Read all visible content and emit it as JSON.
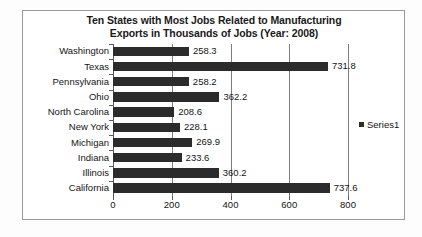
{
  "chart_data": {
    "type": "bar",
    "orientation": "horizontal",
    "title": "Ten States with Most Jobs Related to Manufacturing Exports in Thousands of Jobs (Year: 2008)",
    "title_lines": [
      "Ten States with Most Jobs Related to Manufacturing",
      "Exports in Thousands of Jobs (Year: 2008)"
    ],
    "categories": [
      "Washington",
      "Texas",
      "Pennsylvania",
      "Ohio",
      "North Carolina",
      "New York",
      "Michigan",
      "Indiana",
      "Illinois",
      "California"
    ],
    "values": [
      258.3,
      731.8,
      258.2,
      362.2,
      208.6,
      228.1,
      269.9,
      233.6,
      360.2,
      737.6
    ],
    "value_labels": [
      "258.3",
      "731.8",
      "258.2",
      "362.2",
      "208.6",
      "228.1",
      "269.9",
      "233.6",
      "360.2",
      "737.6"
    ],
    "series": [
      {
        "name": "Series1",
        "values": [
          258.3,
          731.8,
          258.2,
          362.2,
          208.6,
          228.1,
          269.9,
          233.6,
          360.2,
          737.6
        ],
        "color": "#2b2b2b"
      }
    ],
    "xlabel": "",
    "ylabel": "",
    "xlim": [
      0,
      800
    ],
    "xticks": [
      0,
      200,
      400,
      600,
      800
    ],
    "xtick_labels": [
      "0",
      "200",
      "400",
      "600",
      "800"
    ],
    "grid": true,
    "grid_axis": "x",
    "legend": {
      "entries": [
        "Series1"
      ],
      "position": "right",
      "marker_color": "#2b2b2b"
    },
    "data_labels_shown": true,
    "bar_color": "#2b2b2b",
    "plot_background": "#ffffff",
    "frame_border_color": "#9a9a9a"
  }
}
